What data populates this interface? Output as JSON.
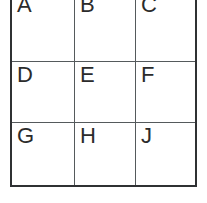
{
  "figure": {
    "type": "grid-table",
    "rows": 3,
    "columns": 3,
    "background_color": "#ffffff",
    "border_color": "#2f3133",
    "inner_rule_color": "#555a5c",
    "text_color": "#2b2b2b"
  },
  "grid": {
    "cells": [
      [
        {
          "label": "A"
        },
        {
          "label": "B"
        },
        {
          "label": "C"
        }
      ],
      [
        {
          "label": "D"
        },
        {
          "label": "E"
        },
        {
          "label": "F"
        }
      ],
      [
        {
          "label": "G"
        },
        {
          "label": "H"
        },
        {
          "label": "J"
        }
      ]
    ]
  }
}
